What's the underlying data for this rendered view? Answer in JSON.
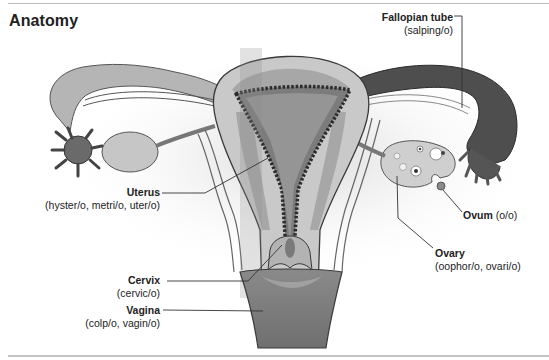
{
  "title": "Anatomy",
  "labels": {
    "fallopian_tube": {
      "name": "Fallopian tube",
      "roots": "(salping/o)"
    },
    "uterus": {
      "name": "Uterus",
      "roots": "(hyster/o, metri/o, uter/o)"
    },
    "ovum": {
      "name": "Ovum",
      "roots": "(o/o)"
    },
    "ovary": {
      "name": "Ovary",
      "roots": "(oophor/o, ovari/o)"
    },
    "cervix": {
      "name": "Cervix",
      "roots": "(cervic/o)"
    },
    "vagina": {
      "name": "Vagina",
      "roots": "(colp/o, vagin/o)"
    }
  },
  "colors": {
    "tissue_light": "#c8c8c8",
    "tissue_mid": "#a9a9a9",
    "tissue_dark": "#6e6e6e",
    "tube_dark": "#4a4a4a",
    "background_glow": "#e6e6e6",
    "leader_line": "#333333"
  }
}
